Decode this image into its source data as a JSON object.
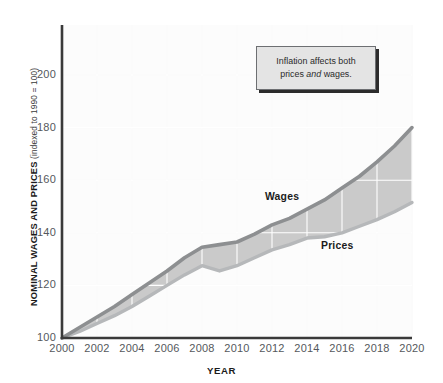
{
  "chart_data": {
    "type": "area",
    "title": "",
    "xlabel": "YEAR",
    "ylabel": "NOMINAL WAGES AND PRICES",
    "ylabel_note": "(indexed to 1990 = 100)",
    "x": [
      2000,
      2001,
      2002,
      2003,
      2004,
      2005,
      2006,
      2007,
      2008,
      2009,
      2010,
      2011,
      2012,
      2013,
      2014,
      2015,
      2016,
      2017,
      2018,
      2019,
      2020
    ],
    "xlim": [
      2000,
      2020
    ],
    "ylim": [
      100,
      210
    ],
    "xticks": [
      "2000",
      "2002",
      "2004",
      "2006",
      "2008",
      "2010",
      "2012",
      "2014",
      "2016",
      "2018",
      "2020"
    ],
    "xtick_values": [
      2000,
      2002,
      2004,
      2006,
      2008,
      2010,
      2012,
      2014,
      2016,
      2018,
      2020
    ],
    "yticks": [
      "100",
      "120",
      "140",
      "160",
      "180",
      "200"
    ],
    "ytick_values": [
      100,
      120,
      140,
      160,
      180,
      200
    ],
    "grid": true,
    "grid_color": "#f2f2f2",
    "legend": "inline-labels",
    "series": [
      {
        "name": "Wages",
        "label": "Wages",
        "line_color": "#8d8f91",
        "values": [
          100,
          104,
          108,
          112,
          116.5,
          121,
          125.5,
          130.5,
          134.5,
          135.5,
          136.5,
          139.5,
          143,
          145.5,
          149,
          152.5,
          157,
          161.5,
          167,
          173,
          180
        ]
      },
      {
        "name": "Prices",
        "label": "Prices",
        "line_color": "#b6b8ba",
        "values": [
          100,
          102.5,
          105.5,
          108.5,
          112,
          116,
          120,
          124,
          127.5,
          125.5,
          127.5,
          130.5,
          133.5,
          135.5,
          138,
          138.5,
          140,
          142.5,
          145,
          148,
          151.5
        ]
      }
    ],
    "band": {
      "fill_color": "#cacaca",
      "between": [
        "Prices",
        "Wages"
      ]
    },
    "annotations": [
      {
        "name": "callout",
        "text_line1": "Inflation affects both",
        "text_line2_prefix": "prices ",
        "text_line2_emphasis": "and",
        "text_line2_suffix": " wages."
      }
    ]
  },
  "axis": {
    "y_title_main": "NOMINAL WAGES AND PRICES",
    "y_title_note": " (indexed to 1990 = 100)",
    "x_title": "YEAR"
  },
  "colors": {
    "axis_line": "#3a3a3a",
    "band_fill": "#cacaca",
    "wages_line": "#8d8f91",
    "prices_line": "#b6b8ba",
    "plot_background": "#fcfcfc",
    "callout_bg": "#e4e4e4",
    "callout_border": "#6d6f72",
    "callout_shadow": "#2c2c2c"
  }
}
